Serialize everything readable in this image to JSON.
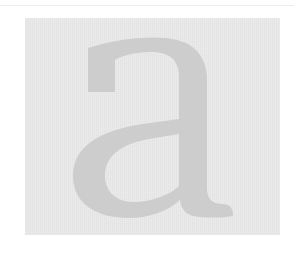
{
  "preview": {
    "glyph": "a",
    "background_color": "#e3e3e3",
    "glyph_color": "#cdcdcd",
    "rule_color": "#ececec"
  }
}
